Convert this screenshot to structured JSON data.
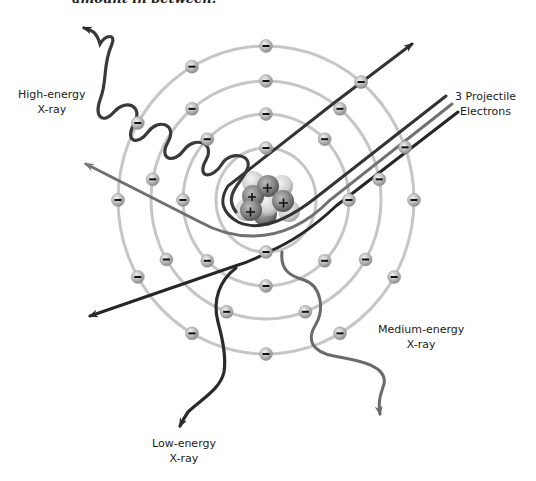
{
  "header": {
    "cut_off_text": "amount in between."
  },
  "labels": {
    "high_energy": {
      "line1": "High-energy",
      "line2": "X-ray"
    },
    "projectile": {
      "line1": "3 Projectile",
      "line2": "Electrons"
    },
    "medium_energy": {
      "line1": "Medium-energy",
      "line2": "X-ray"
    },
    "low_energy": {
      "line1": "Low-energy",
      "line2": "X-ray"
    }
  },
  "diagram": {
    "nucleus": {
      "cx": 266,
      "cy": 200,
      "charge_symbol": "+",
      "proton_count_visible": 4
    },
    "orbits": [
      {
        "rx": 50,
        "ry": 52
      },
      {
        "rx": 83,
        "ry": 86
      },
      {
        "rx": 115,
        "ry": 119
      },
      {
        "rx": 148,
        "ry": 154
      }
    ],
    "electron_symbol": "−",
    "colors": {
      "orbit": "#c6c6c6",
      "electron": "#b5b5b5",
      "path_dark": "#2e2e2e",
      "path_medium": "#5c5c5c",
      "path_light": "#7a7a7a",
      "background": "#ffffff"
    }
  }
}
